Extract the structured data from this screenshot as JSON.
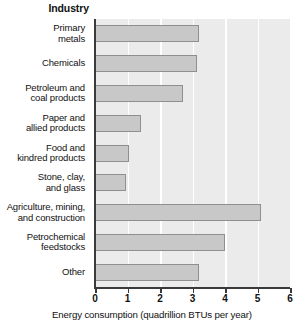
{
  "chart_data": {
    "type": "bar",
    "orientation": "horizontal",
    "title": "",
    "xlabel": "Energy consumption (quadrillion BTUs per year)",
    "ylabel": "Industry",
    "xlim": [
      0,
      6
    ],
    "xticks": [
      0,
      1,
      2,
      3,
      4,
      5,
      6
    ],
    "xtick_labels": [
      "0",
      "1",
      "2",
      "3",
      "4",
      "5",
      "6"
    ],
    "grid": "vertical-white-gridlines",
    "legend": "none",
    "categories": [
      "Primary\nmetals",
      "Chemicals",
      "Petroleum and\ncoal products",
      "Paper and\nallied products",
      "Food and\nkindred products",
      "Stone, clay,\nand glass",
      "Agriculture, mining,\nand construction",
      "Petrochemical\nfeedstocks",
      "Other"
    ],
    "values": [
      3.2,
      3.15,
      2.7,
      1.4,
      1.05,
      0.95,
      5.1,
      4.0,
      3.2
    ],
    "bar_color": "#c8c8c8",
    "bar_edge_color": "#8f8f8f",
    "plot_background": "#ebebeb",
    "gridline_color": "#ffffff",
    "axis_color": "#3a3a3a"
  }
}
